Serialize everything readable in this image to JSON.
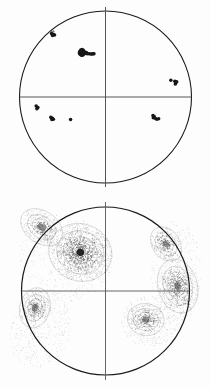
{
  "figure": {
    "title": "",
    "background_color": "#fdfdfd",
    "width": 211,
    "height": 387,
    "line_color": "#1a1a1a",
    "axis_color": "#555555",
    "point_color": "#161616",
    "contour_color": "#4a4a4a"
  },
  "chart_data": [
    {
      "type": "scatter",
      "name": "stereonet-scatter",
      "title": "",
      "subtitle": "",
      "xlabel": "",
      "ylabel": "",
      "projection": "equal-area lower hemisphere stereonet",
      "xlim": [
        -1,
        1
      ],
      "ylim": [
        -1,
        1
      ],
      "grid": false,
      "legend": null,
      "annotations": [
        {
          "text": "N",
          "x": -0.62,
          "y": 0.74
        }
      ],
      "primitive_circle": {
        "cx": 0,
        "cy": 0,
        "r": 1
      },
      "crosshair": {
        "horizontal": true,
        "vertical": true
      },
      "clusters": [
        {
          "name": "cluster-main-nw",
          "cx": -0.26,
          "cy": 0.5,
          "n": 22
        },
        {
          "name": "cluster-rim-nw",
          "cx": -0.61,
          "cy": 0.72,
          "n": 4
        },
        {
          "name": "cluster-e",
          "cx": 0.8,
          "cy": 0.17,
          "n": 5
        },
        {
          "name": "cluster-sw-edge",
          "cx": -0.8,
          "cy": -0.13,
          "n": 3
        },
        {
          "name": "cluster-sw-inner",
          "cx": -0.62,
          "cy": -0.25,
          "n": 4
        },
        {
          "name": "cluster-sw-single",
          "cx": -0.41,
          "cy": -0.26,
          "n": 1
        },
        {
          "name": "cluster-se",
          "cx": 0.58,
          "cy": -0.24,
          "n": 6
        }
      ],
      "points": [
        [
          -0.3,
          0.53
        ],
        [
          -0.288,
          0.546
        ],
        [
          -0.272,
          0.552
        ],
        [
          -0.258,
          0.545
        ],
        [
          -0.248,
          0.53
        ],
        [
          -0.244,
          0.512
        ],
        [
          -0.252,
          0.496
        ],
        [
          -0.266,
          0.486
        ],
        [
          -0.282,
          0.486
        ],
        [
          -0.296,
          0.496
        ],
        [
          -0.304,
          0.512
        ],
        [
          -0.286,
          0.518
        ],
        [
          -0.272,
          0.522
        ],
        [
          -0.262,
          0.514
        ],
        [
          -0.232,
          0.508
        ],
        [
          -0.212,
          0.504
        ],
        [
          -0.192,
          0.502
        ],
        [
          -0.172,
          0.5
        ],
        [
          -0.156,
          0.5
        ],
        [
          -0.144,
          0.502
        ],
        [
          -0.134,
          0.504
        ],
        [
          -0.222,
          0.516
        ],
        [
          -0.628,
          0.738
        ],
        [
          -0.606,
          0.73
        ],
        [
          -0.592,
          0.722
        ],
        [
          -0.616,
          0.714
        ],
        [
          0.76,
          0.196
        ],
        [
          0.806,
          0.182
        ],
        [
          0.818,
          0.166
        ],
        [
          0.812,
          0.15
        ],
        [
          0.828,
          0.176
        ],
        [
          -0.806,
          -0.106
        ],
        [
          -0.786,
          -0.122
        ],
        [
          -0.798,
          -0.136
        ],
        [
          -0.636,
          -0.236
        ],
        [
          -0.618,
          -0.246
        ],
        [
          -0.606,
          -0.258
        ],
        [
          -0.624,
          -0.262
        ],
        [
          -0.406,
          -0.262
        ],
        [
          0.552,
          -0.216
        ],
        [
          0.566,
          -0.228
        ],
        [
          0.556,
          -0.242
        ],
        [
          0.578,
          -0.246
        ],
        [
          0.596,
          -0.258
        ],
        [
          0.618,
          -0.252
        ]
      ]
    },
    {
      "type": "contour",
      "name": "stereonet-density-contour",
      "title": "",
      "subtitle": "",
      "xlabel": "",
      "ylabel": "",
      "projection": "equal-area lower hemisphere stereonet",
      "xlim": [
        -1,
        1
      ],
      "ylim": [
        -1,
        1
      ],
      "grid": false,
      "legend": null,
      "annotations": [],
      "style": "stippled density bands",
      "primitive_circle": {
        "cx": 0,
        "cy": 0,
        "r": 1
      },
      "crosshair": {
        "horizontal": true,
        "vertical": true
      },
      "contour_levels": [
        1,
        2,
        3,
        4,
        5,
        6
      ],
      "maxima": [
        {
          "name": "maximum-primary-nw",
          "cx": -0.3,
          "cy": 0.46,
          "peak_level": 6,
          "radii": [
            0.055,
            0.095,
            0.135,
            0.185,
            0.255,
            0.34
          ],
          "elongation": 1.12,
          "rotation_deg": 20
        },
        {
          "name": "maximum-secondary-nw-rim",
          "cx": -0.76,
          "cy": 0.76,
          "peak_level": 4,
          "radii": [
            0.05,
            0.085,
            0.13,
            0.19
          ],
          "elongation": 1.45,
          "rotation_deg": 35
        },
        {
          "name": "maximum-e",
          "cx": 0.86,
          "cy": 0.06,
          "peak_level": 5,
          "radii": [
            0.048,
            0.082,
            0.122,
            0.17,
            0.235
          ],
          "elongation": 1.4,
          "rotation_deg": 75
        },
        {
          "name": "maximum-ne-rim",
          "cx": 0.72,
          "cy": 0.56,
          "peak_level": 4,
          "radii": [
            0.045,
            0.078,
            0.115,
            0.165
          ],
          "elongation": 1.35,
          "rotation_deg": 55
        },
        {
          "name": "maximum-sw",
          "cx": -0.84,
          "cy": -0.2,
          "peak_level": 4,
          "radii": [
            0.048,
            0.082,
            0.122,
            0.18
          ],
          "elongation": 1.35,
          "rotation_deg": 105
        },
        {
          "name": "maximum-se",
          "cx": 0.48,
          "cy": -0.34,
          "peak_level": 4,
          "radii": [
            0.05,
            0.088,
            0.132,
            0.19
          ],
          "elongation": 1.15,
          "rotation_deg": 10
        }
      ],
      "halo_regions": [
        {
          "name": "halo-nw-lobe",
          "cx": -0.48,
          "cy": 0.4,
          "rx": 0.58,
          "ry": 0.5,
          "rotation_deg": 30,
          "level": 1
        },
        {
          "name": "halo-sw-lobe",
          "cx": -0.78,
          "cy": -0.46,
          "rx": 0.36,
          "ry": 0.46,
          "rotation_deg": 20,
          "level": 1
        },
        {
          "name": "halo-e-lobe",
          "cx": 0.84,
          "cy": 0.22,
          "rx": 0.3,
          "ry": 0.62,
          "rotation_deg": 0,
          "level": 1
        },
        {
          "name": "halo-se-lobe",
          "cx": 0.52,
          "cy": -0.36,
          "rx": 0.34,
          "ry": 0.3,
          "rotation_deg": 0,
          "level": 1
        }
      ]
    }
  ]
}
